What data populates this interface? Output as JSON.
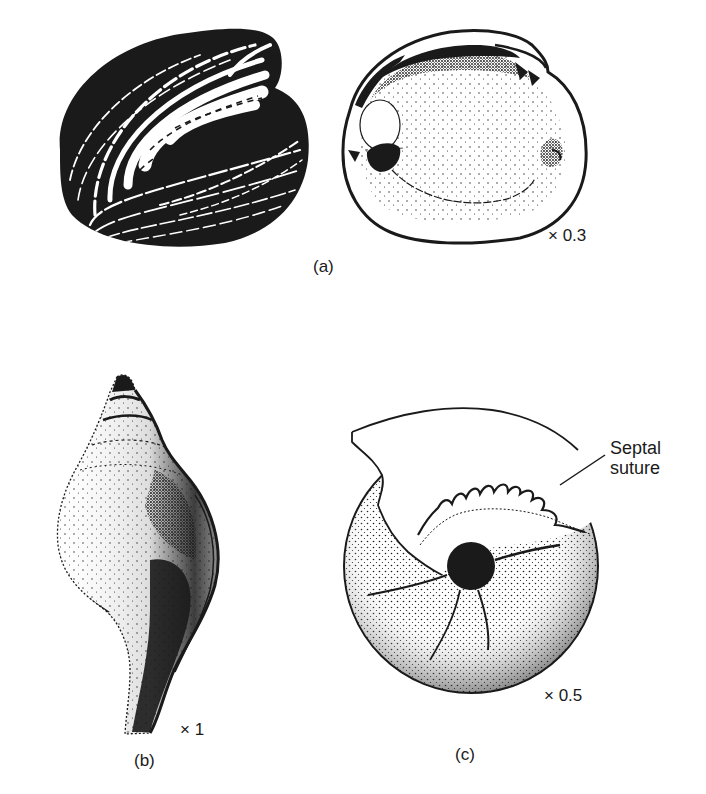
{
  "figure": {
    "panels": [
      {
        "id": "a",
        "label": "(a)",
        "scale": "× 0.3",
        "specimens": [
          "bivalve-shell-exterior",
          "bivalve-shell-interior"
        ]
      },
      {
        "id": "b",
        "label": "(b)",
        "scale": "× 1",
        "specimens": [
          "gastropod-shell"
        ]
      },
      {
        "id": "c",
        "label": "(c)",
        "scale": "× 0.5",
        "specimens": [
          "ammonite-shell"
        ],
        "annotation": {
          "line1": "Septal",
          "line2": "suture"
        }
      }
    ]
  },
  "colors": {
    "ink": "#1a1a1a",
    "background": "#ffffff"
  }
}
